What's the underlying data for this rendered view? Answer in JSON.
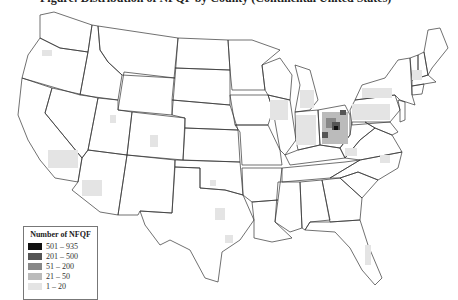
{
  "title": "Figure: Distribution of NFQF by County (Continental United States)",
  "legend": {
    "title": "Number of NFQF",
    "items": [
      {
        "label": "501 – 935",
        "color": "#111111"
      },
      {
        "label": "201 – 500",
        "color": "#555555"
      },
      {
        "label": "51 – 200",
        "color": "#888888"
      },
      {
        "label": "21 – 50",
        "color": "#bbbbbb"
      },
      {
        "label": "1 – 20",
        "color": "#e4e4e4"
      }
    ]
  },
  "regions": [
    {
      "name": "Ohio",
      "level": "501 – 935"
    },
    {
      "name": "Indiana",
      "level": "1 – 20"
    },
    {
      "name": "Michigan",
      "level": "1 – 20"
    },
    {
      "name": "Pennsylvania",
      "level": "1 – 20"
    },
    {
      "name": "California",
      "level": "21 – 50"
    },
    {
      "name": "Arizona",
      "level": "1 – 20"
    },
    {
      "name": "Texas",
      "level": "1 – 20"
    },
    {
      "name": "Florida",
      "level": "1 – 20"
    }
  ]
}
